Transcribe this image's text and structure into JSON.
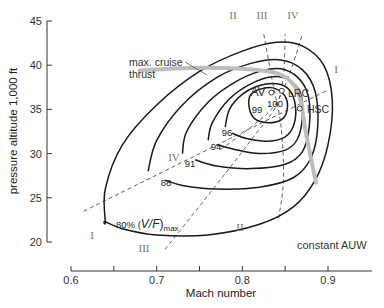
{
  "chart_data": {
    "type": "line",
    "subtype": "contour",
    "title": "",
    "xlabel": "Mach number",
    "ylabel": "pressure altitude 1,000 ft",
    "xlim": [
      0.6,
      0.95
    ],
    "ylim": [
      20,
      45
    ],
    "x_ticks": [
      0.6,
      0.65,
      0.7,
      0.75,
      0.8,
      0.85,
      0.9
    ],
    "x_tick_labels": [
      "0.6",
      "",
      "0.7",
      "",
      "0.8",
      "",
      "0.9"
    ],
    "y_ticks": [
      20,
      25,
      30,
      35,
      40,
      45
    ],
    "y_tick_labels": [
      "20",
      "25",
      "30",
      "35",
      "40",
      "45"
    ],
    "grid": false,
    "annotation_corner": "constant AUW",
    "thrust_label": [
      "max. cruise",
      "thrust"
    ],
    "contours": [
      {
        "label": "80% (V/F)max",
        "label_main": "80% (",
        "label_italic": "V/F",
        "label_close": ")",
        "label_sub": "max",
        "level": 80,
        "points": [
          [
            0.64,
            22.3
          ],
          [
            0.64,
            26
          ],
          [
            0.66,
            31
          ],
          [
            0.7,
            35.5
          ],
          [
            0.75,
            39.3
          ],
          [
            0.8,
            41.6
          ],
          [
            0.84,
            42.6
          ],
          [
            0.87,
            42.2
          ],
          [
            0.895,
            40
          ],
          [
            0.905,
            36
          ],
          [
            0.9,
            31
          ],
          [
            0.885,
            27
          ],
          [
            0.86,
            24
          ],
          [
            0.82,
            22
          ],
          [
            0.76,
            20.8
          ],
          [
            0.7,
            20.8
          ],
          [
            0.66,
            21.5
          ],
          [
            0.64,
            22.3
          ]
        ]
      },
      {
        "label": "88",
        "level": 88,
        "points": [
          [
            0.69,
            28
          ],
          [
            0.7,
            31.5
          ],
          [
            0.73,
            35.5
          ],
          [
            0.77,
            38.6
          ],
          [
            0.81,
            40.2
          ],
          [
            0.845,
            40.6
          ],
          [
            0.87,
            39.5
          ],
          [
            0.885,
            37
          ],
          [
            0.888,
            33
          ],
          [
            0.88,
            29.5
          ],
          [
            0.86,
            27.3
          ],
          [
            0.82,
            26.2
          ],
          [
            0.77,
            26
          ],
          [
            0.73,
            26.4
          ],
          [
            0.71,
            27
          ]
        ]
      },
      {
        "label": "91",
        "level": 91,
        "points": [
          [
            0.73,
            30
          ],
          [
            0.735,
            32.5
          ],
          [
            0.76,
            35.8
          ],
          [
            0.79,
            38
          ],
          [
            0.82,
            39.3
          ],
          [
            0.845,
            39.6
          ],
          [
            0.865,
            38.6
          ],
          [
            0.877,
            36.5
          ],
          [
            0.878,
            33
          ],
          [
            0.87,
            30.2
          ],
          [
            0.85,
            28.8
          ],
          [
            0.81,
            28.3
          ],
          [
            0.77,
            28.6
          ],
          [
            0.745,
            29.3
          ]
        ]
      },
      {
        "label": "94",
        "level": 94,
        "points": [
          [
            0.76,
            31.5
          ],
          [
            0.765,
            33.5
          ],
          [
            0.785,
            36.2
          ],
          [
            0.81,
            37.9
          ],
          [
            0.835,
            38.7
          ],
          [
            0.855,
            38.3
          ],
          [
            0.868,
            36.8
          ],
          [
            0.87,
            34
          ],
          [
            0.864,
            31.6
          ],
          [
            0.85,
            30.4
          ],
          [
            0.82,
            30
          ],
          [
            0.79,
            30.5
          ],
          [
            0.77,
            31
          ]
        ]
      },
      {
        "label": "96",
        "level": 96,
        "points": [
          [
            0.78,
            33
          ],
          [
            0.785,
            35
          ],
          [
            0.8,
            36.7
          ],
          [
            0.82,
            37.7
          ],
          [
            0.84,
            37.9
          ],
          [
            0.855,
            37.2
          ],
          [
            0.862,
            35.4
          ],
          [
            0.86,
            33.2
          ],
          [
            0.85,
            31.9
          ],
          [
            0.83,
            31.4
          ],
          [
            0.805,
            31.7
          ],
          [
            0.788,
            32.3
          ]
        ]
      },
      {
        "label": "99",
        "level": 99,
        "points": [
          [
            0.808,
            35.2
          ],
          [
            0.81,
            36.7
          ],
          [
            0.825,
            37.4
          ],
          [
            0.84,
            37.3
          ],
          [
            0.851,
            36.3
          ],
          [
            0.852,
            34.8
          ],
          [
            0.845,
            33.8
          ],
          [
            0.83,
            33.5
          ],
          [
            0.815,
            33.9
          ]
        ]
      },
      {
        "label": "100",
        "level": 100,
        "points": []
      }
    ],
    "rays": [
      {
        "label": "I",
        "points": [
          [
            0.615,
            23.5
          ],
          [
            0.9,
            37.2
          ]
        ]
      },
      {
        "label": "II",
        "points": [
          [
            0.825,
            43.5
          ],
          [
            0.835,
            38.2
          ],
          [
            0.845,
            33.2
          ],
          [
            0.848,
            27
          ],
          [
            0.842,
            22.5
          ]
        ]
      },
      {
        "label": "III",
        "points": [
          [
            0.71,
            19.2
          ],
          [
            0.77,
            26.5
          ],
          [
            0.81,
            31.5
          ],
          [
            0.84,
            35.5
          ],
          [
            0.848,
            39
          ],
          [
            0.85,
            43.5
          ]
        ]
      },
      {
        "label": "IV",
        "points": [
          [
            0.775,
            30.5
          ],
          [
            0.81,
            33
          ],
          [
            0.838,
            35.5
          ],
          [
            0.855,
            39
          ],
          [
            0.87,
            43.5
          ]
        ]
      }
    ],
    "thrust_line": [
      [
        0.68,
        39.4
      ],
      [
        0.74,
        39.7
      ],
      [
        0.8,
        39.6
      ],
      [
        0.84,
        39.1
      ],
      [
        0.86,
        37.8
      ],
      [
        0.868,
        36
      ],
      [
        0.873,
        33
      ],
      [
        0.88,
        29.5
      ],
      [
        0.886,
        26.7
      ]
    ],
    "points": [
      {
        "label": "AV",
        "x": 0.834,
        "y": 36.9
      },
      {
        "label": "LRC",
        "x": 0.846,
        "y": 37.1
      },
      {
        "label": "HSC",
        "x": 0.867,
        "y": 35.1
      }
    ],
    "peak_label": "100"
  }
}
